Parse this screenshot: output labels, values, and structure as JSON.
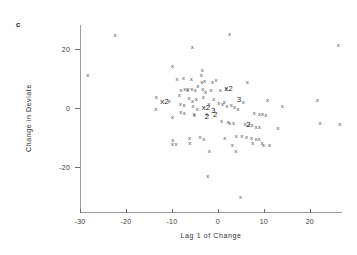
{
  "panel": {
    "label": "c"
  },
  "chart_data": {
    "type": "scatter",
    "title": "",
    "xlabel": "Lag 1 of Change",
    "ylabel": "Change in Deviate",
    "xlim": [
      -30,
      27
    ],
    "ylim": [
      -35,
      28
    ],
    "xticks": [
      -30,
      -20,
      -10,
      0,
      10,
      20
    ],
    "xticklabels": [
      "-30",
      "-20",
      "-10",
      "0",
      "10",
      "20"
    ],
    "yticks": [
      20,
      0,
      -20
    ],
    "yticklabels": [
      "20",
      "0",
      "-20"
    ],
    "grid": false,
    "legend": null,
    "marker": "x",
    "overplot_note": "Digits 2 and 3 mark locations where 2 or 3 points coincide",
    "points": [
      {
        "x": -28.3,
        "y": 11.0,
        "label": "x"
      },
      {
        "x": -22.4,
        "y": 24.6,
        "label": "x"
      },
      {
        "x": -13.4,
        "y": 3.6,
        "label": "x"
      },
      {
        "x": -13.5,
        "y": -0.3,
        "label": "x"
      },
      {
        "x": -11.6,
        "y": 2.2,
        "label": "x2"
      },
      {
        "x": -10.6,
        "y": 2.4,
        "label": "x"
      },
      {
        "x": -9.9,
        "y": 14.3,
        "label": "x"
      },
      {
        "x": -9.9,
        "y": -2.9,
        "label": "x"
      },
      {
        "x": -9.8,
        "y": -10.6,
        "label": "x"
      },
      {
        "x": -9.9,
        "y": -12.2,
        "label": "x"
      },
      {
        "x": -9.1,
        "y": -12.1,
        "label": "x"
      },
      {
        "x": -8.9,
        "y": 9.8,
        "label": "x"
      },
      {
        "x": -8.4,
        "y": 4.4,
        "label": "x"
      },
      {
        "x": -8.2,
        "y": 1.3,
        "label": "x"
      },
      {
        "x": -8.1,
        "y": -1.2,
        "label": "x"
      },
      {
        "x": -8.0,
        "y": 6.0,
        "label": "x"
      },
      {
        "x": -7.5,
        "y": 10.3,
        "label": "x"
      },
      {
        "x": -7.4,
        "y": 1.2,
        "label": "x"
      },
      {
        "x": -7.3,
        "y": -1.6,
        "label": "x"
      },
      {
        "x": -7.2,
        "y": 6.3,
        "label": "x"
      },
      {
        "x": -6.6,
        "y": 6.2,
        "label": "x"
      },
      {
        "x": -6.5,
        "y": 6.6,
        "label": "x"
      },
      {
        "x": -6.3,
        "y": 3.5,
        "label": "x"
      },
      {
        "x": -6.2,
        "y": -10.0,
        "label": "x"
      },
      {
        "x": -6.1,
        "y": -11.7,
        "label": "x"
      },
      {
        "x": -5.8,
        "y": 9.9,
        "label": "x"
      },
      {
        "x": -5.7,
        "y": 6.4,
        "label": "x"
      },
      {
        "x": -5.6,
        "y": 20.5,
        "label": "x"
      },
      {
        "x": -5.5,
        "y": 2.4,
        "label": "x"
      },
      {
        "x": -5.4,
        "y": 0.6,
        "label": "x"
      },
      {
        "x": -5.2,
        "y": -1.9,
        "label": "x"
      },
      {
        "x": -5.1,
        "y": -2.2,
        "label": "x"
      },
      {
        "x": -4.9,
        "y": 6.1,
        "label": "x"
      },
      {
        "x": -4.7,
        "y": 3.2,
        "label": "x"
      },
      {
        "x": -4.5,
        "y": -0.4,
        "label": "x"
      },
      {
        "x": -4.4,
        "y": 7.5,
        "label": "x"
      },
      {
        "x": -3.9,
        "y": -9.9,
        "label": "x"
      },
      {
        "x": -3.6,
        "y": 11.2,
        "label": "x"
      },
      {
        "x": -3.5,
        "y": 8.9,
        "label": "x"
      },
      {
        "x": -3.4,
        "y": 12.7,
        "label": "x"
      },
      {
        "x": -3.3,
        "y": 6.5,
        "label": "x"
      },
      {
        "x": -3.2,
        "y": 3.6,
        "label": "x"
      },
      {
        "x": -3.1,
        "y": -10.3,
        "label": "x"
      },
      {
        "x": -2.9,
        "y": 9.0,
        "label": "x"
      },
      {
        "x": -2.7,
        "y": 5.3,
        "label": "x"
      },
      {
        "x": -2.6,
        "y": 0.0,
        "label": "x2"
      },
      {
        "x": -2.5,
        "y": -2.0,
        "label": "x"
      },
      {
        "x": -2.4,
        "y": -2.9,
        "label": "2"
      },
      {
        "x": -2.2,
        "y": -22.8,
        "label": "x"
      },
      {
        "x": -2.0,
        "y": 1.4,
        "label": "x"
      },
      {
        "x": -1.9,
        "y": -14.5,
        "label": "x"
      },
      {
        "x": -1.5,
        "y": 6.1,
        "label": "x"
      },
      {
        "x": -1.2,
        "y": 8.7,
        "label": "x"
      },
      {
        "x": -1.0,
        "y": -1.0,
        "label": "3"
      },
      {
        "x": -0.9,
        "y": 3.1,
        "label": "x"
      },
      {
        "x": -0.6,
        "y": -2.4,
        "label": "2"
      },
      {
        "x": -0.4,
        "y": 9.4,
        "label": "x"
      },
      {
        "x": 0.2,
        "y": 1.6,
        "label": "x"
      },
      {
        "x": 0.5,
        "y": 6.0,
        "label": "x"
      },
      {
        "x": 0.8,
        "y": -4.5,
        "label": "x"
      },
      {
        "x": 1.0,
        "y": 1.4,
        "label": "x"
      },
      {
        "x": 1.4,
        "y": 2.1,
        "label": "x"
      },
      {
        "x": 1.5,
        "y": -10.2,
        "label": "x"
      },
      {
        "x": 1.8,
        "y": 6.3,
        "label": "x"
      },
      {
        "x": 2.0,
        "y": 0.8,
        "label": "x"
      },
      {
        "x": 2.2,
        "y": -4.7,
        "label": "x"
      },
      {
        "x": 2.3,
        "y": 6.6,
        "label": "x2"
      },
      {
        "x": 2.5,
        "y": 24.8,
        "label": "x"
      },
      {
        "x": 2.6,
        "y": -4.9,
        "label": "x"
      },
      {
        "x": 2.9,
        "y": 1.2,
        "label": "x"
      },
      {
        "x": 3.1,
        "y": -12.3,
        "label": "x"
      },
      {
        "x": 3.4,
        "y": -5.1,
        "label": "x"
      },
      {
        "x": 3.6,
        "y": 0.5,
        "label": "x"
      },
      {
        "x": 3.9,
        "y": -14.6,
        "label": "x"
      },
      {
        "x": 4.0,
        "y": -9.4,
        "label": "x"
      },
      {
        "x": 4.4,
        "y": -0.4,
        "label": "x"
      },
      {
        "x": 4.6,
        "y": 2.6,
        "label": "3"
      },
      {
        "x": 4.9,
        "y": -30.1,
        "label": "x"
      },
      {
        "x": 5.2,
        "y": -9.3,
        "label": "x"
      },
      {
        "x": 5.5,
        "y": 1.9,
        "label": "x"
      },
      {
        "x": 5.9,
        "y": -5.4,
        "label": "x"
      },
      {
        "x": 6.2,
        "y": -9.7,
        "label": "x"
      },
      {
        "x": 6.4,
        "y": 8.9,
        "label": "x"
      },
      {
        "x": 6.6,
        "y": -5.6,
        "label": "2"
      },
      {
        "x": 7.1,
        "y": -5.8,
        "label": "xx"
      },
      {
        "x": 7.3,
        "y": -10.1,
        "label": "x"
      },
      {
        "x": 7.6,
        "y": -11.6,
        "label": "x"
      },
      {
        "x": 7.9,
        "y": -1.8,
        "label": "x"
      },
      {
        "x": 8.3,
        "y": -6.2,
        "label": "x"
      },
      {
        "x": 8.6,
        "y": -10.5,
        "label": "xx"
      },
      {
        "x": 9.0,
        "y": -6.4,
        "label": "x"
      },
      {
        "x": 9.4,
        "y": -2.1,
        "label": "xx"
      },
      {
        "x": 9.6,
        "y": -11.9,
        "label": "x"
      },
      {
        "x": 9.9,
        "y": -12.3,
        "label": "x"
      },
      {
        "x": 10.4,
        "y": -2.3,
        "label": "x"
      },
      {
        "x": 10.8,
        "y": 2.8,
        "label": "x"
      },
      {
        "x": 11.2,
        "y": -12.4,
        "label": "x"
      },
      {
        "x": 13.1,
        "y": -6.8,
        "label": "x"
      },
      {
        "x": 14.0,
        "y": 0.6,
        "label": "x"
      },
      {
        "x": 21.6,
        "y": 2.9,
        "label": "x"
      },
      {
        "x": 22.2,
        "y": -5.1,
        "label": "x"
      },
      {
        "x": 26.2,
        "y": 21.3,
        "label": "x"
      },
      {
        "x": 26.5,
        "y": -5.3,
        "label": "x"
      }
    ]
  }
}
